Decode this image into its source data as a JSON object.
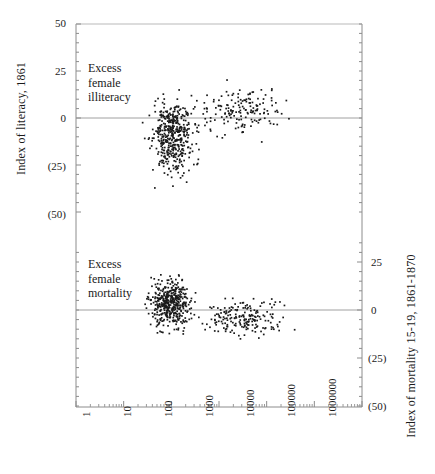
{
  "chart_data": {
    "type": "scatter",
    "title": "",
    "subtitle": "",
    "xlabel": "",
    "xscale": "log",
    "xlim": [
      1,
      1000000
    ],
    "xticks": [
      1,
      10,
      100,
      1000,
      10000,
      100000,
      1000000
    ],
    "xticklabels": [
      "1",
      "10",
      "100",
      "1000",
      "10000",
      "100000",
      "1000000"
    ],
    "grid": false,
    "legend": null,
    "panels": [
      {
        "name": "literacy-panel",
        "ylabel": "Index of literacy, 1861",
        "ylabel_side": "left",
        "ylim": [
          -50,
          50
        ],
        "yticks": [
          50,
          25,
          0,
          -25,
          -50
        ],
        "yticklabels": [
          "50",
          "25",
          "0",
          "(25)",
          "(50)"
        ],
        "zero_line": 0,
        "annotation": "Excess\nfemale\nilliteracy",
        "annotation_lines": [
          "Excess",
          "female",
          "illiteracy"
        ],
        "annotation_x": 6,
        "annotation_y": 16,
        "n_points": 620,
        "cluster_center_x": 100,
        "cluster_center_y": -9,
        "x_spread_decades": 0.32,
        "y_spread": 13,
        "tail_fraction": 0.26,
        "tail_center_x": 3000,
        "tail_center_y": 4,
        "tail_y_spread": 8,
        "x_range_observed": [
          8,
          40000
        ],
        "y_range_observed": [
          -46,
          41
        ]
      },
      {
        "name": "mortality-panel",
        "ylabel": "Index of mortality 15-19, 1861-1870",
        "ylabel_side": "right",
        "ylim": [
          -50,
          37
        ],
        "yticks": [
          25,
          0,
          -25,
          -50
        ],
        "yticklabels": [
          "25",
          "0",
          "(25)",
          "(50)"
        ],
        "zero_line": 0,
        "annotation": "Excess\nfemale\nmortality",
        "annotation_lines": [
          "Excess",
          "female",
          "mortality"
        ],
        "annotation_x": 6,
        "annotation_y": 22,
        "n_points": 640,
        "cluster_center_x": 90,
        "cluster_center_y": 4,
        "x_spread_decades": 0.3,
        "y_spread": 9,
        "tail_fraction": 0.3,
        "tail_center_x": 3000,
        "tail_center_y": -4,
        "tail_y_spread": 7,
        "x_range_observed": [
          10,
          50000
        ],
        "y_range_observed": [
          -30,
          33
        ]
      }
    ]
  },
  "axes": {
    "left_title": "Index of literacy, 1861",
    "right_title": "Index of mortality 15-19, 1861-1870",
    "left_ticks": [
      "50",
      "25",
      "0",
      "(25)",
      "(50)"
    ],
    "right_ticks": [
      "25",
      "0",
      "(25)",
      "(50)"
    ],
    "x_ticks": [
      "1",
      "10",
      "100",
      "1000",
      "10000",
      "100000",
      "1000000"
    ]
  },
  "annotations": {
    "upper": [
      "Excess",
      "female",
      "illiteracy"
    ],
    "lower": [
      "Excess",
      "female",
      "mortality"
    ]
  },
  "colors": {
    "point": "#1a1a1a",
    "axis": "#808080",
    "zero_line": "#9a9a9a",
    "text": "#1a1a1a",
    "background": "#ffffff"
  }
}
